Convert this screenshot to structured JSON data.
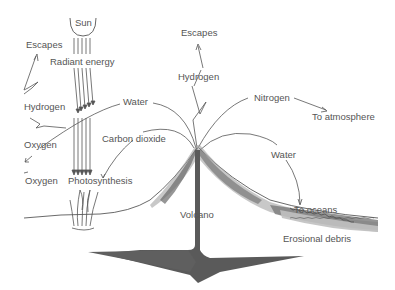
{
  "diagram": {
    "labels": {
      "sun": "Sun",
      "radiant_energy": "Radiant energy",
      "escapes_left": "Escapes",
      "hydrogen_left": "Hydrogen",
      "oxygen_upper": "Oxygen",
      "oxygen_lower": "Oxygen",
      "photosynthesis": "Photosynthesis",
      "water_left": "Water",
      "carbon_dioxide": "Carbon dioxide",
      "escapes_top": "Escapes",
      "hydrogen_top": "Hydrogen",
      "nitrogen": "Nitrogen",
      "to_atmosphere": "To atmosphere",
      "water_right": "Water",
      "to_oceans": "To oceans",
      "volcano": "Volcano",
      "erosional_debris": "Erosional debris"
    },
    "colors": {
      "line": "#555555",
      "magma": "#5a5a5a",
      "volcano_shade": "#888888",
      "debris_light": "#b8b8b8",
      "text": "#555555"
    }
  }
}
